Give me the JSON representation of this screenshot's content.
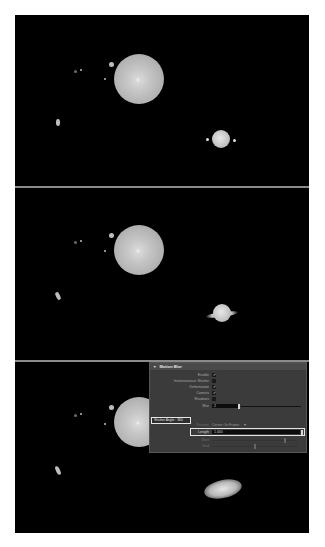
{
  "figure": {
    "frames": [
      {
        "name": "frame-no-blur",
        "description": "Solar system render without motion blur"
      },
      {
        "name": "frame-motion-blur",
        "description": "Solar system render with motion blur"
      },
      {
        "name": "frame-motion-blur-settings",
        "description": "Render with Motion Blur settings panel overlay"
      }
    ]
  },
  "motion_blur_panel": {
    "title": "Motion Blur",
    "rows": {
      "enable": {
        "label": "Enable",
        "checked": "✓"
      },
      "instantaneous_shutter": {
        "label": "Instantaneous Shutter",
        "checked": ""
      },
      "deformation": {
        "label": "Deformation",
        "checked": "✓"
      },
      "camera": {
        "label": "Camera",
        "checked": "✓"
      },
      "shadows": {
        "label": "Shadows",
        "checked": ""
      },
      "blur": {
        "label": "Blur",
        "value": "2"
      },
      "position": {
        "label": "Position",
        "value": "Center On Frame",
        "arrow": "▾"
      },
      "length": {
        "label": "Length",
        "value": "1.000"
      },
      "start": {
        "label": "Start"
      },
      "end": {
        "label": "End"
      }
    },
    "shutter_angle_callout": "Shutter Angle : 360"
  },
  "colors": {
    "background": "#000000",
    "panel": "#3b3b3b",
    "highlight_box": "#e6e6e6"
  }
}
